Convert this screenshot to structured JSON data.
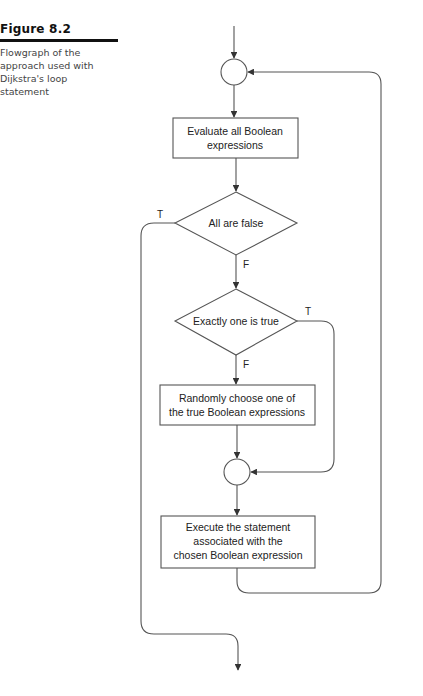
{
  "caption": {
    "title": "Figure 8.2",
    "text": "Flowgraph of the approach used with Dijkstra's loop statement"
  },
  "flowchart": {
    "nodes": [
      {
        "id": "join1",
        "type": "junction"
      },
      {
        "id": "eval",
        "type": "process",
        "lines": [
          "Evaluate all Boolean",
          "expressions"
        ]
      },
      {
        "id": "allfalse",
        "type": "decision",
        "label": "All are false"
      },
      {
        "id": "exactlyone",
        "type": "decision",
        "label": "Exactly one is true"
      },
      {
        "id": "choose",
        "type": "process",
        "lines": [
          "Randomly choose one of",
          "the true Boolean expressions"
        ]
      },
      {
        "id": "join2",
        "type": "junction"
      },
      {
        "id": "execute",
        "type": "process",
        "lines": [
          "Execute the statement",
          "associated with the",
          "chosen Boolean expression"
        ]
      }
    ],
    "edge_labels": {
      "allfalse_true": "T",
      "allfalse_false": "F",
      "exactlyone_true": "T",
      "exactlyone_false": "F"
    },
    "colors": {
      "line": "#555555",
      "text": "#222222"
    }
  }
}
